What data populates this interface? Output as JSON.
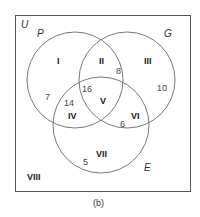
{
  "diagram": {
    "type": "venn-3-set",
    "caption": "(b)",
    "universe": {
      "label": "U"
    },
    "sets": [
      {
        "id": "P",
        "label": "P"
      },
      {
        "id": "G",
        "label": "G"
      },
      {
        "id": "E",
        "label": "E"
      }
    ],
    "regions": {
      "I": {
        "label": "I",
        "count": "7",
        "description": "P only"
      },
      "II": {
        "label": "II",
        "count": "8",
        "description": "P and G only"
      },
      "III": {
        "label": "III",
        "count": "10",
        "description": "G only"
      },
      "IV": {
        "label": "IV",
        "count": "14",
        "description": "P and E only"
      },
      "V": {
        "label": "V",
        "count": "16",
        "description": "P, G and E"
      },
      "VI": {
        "label": "VI",
        "count": "6",
        "description": "G and E only"
      },
      "VII": {
        "label": "VII",
        "count": "5",
        "description": "E only"
      },
      "VIII": {
        "label": "VIII",
        "count": "",
        "description": "outside P, G and E"
      }
    },
    "colors": {
      "frame": "#555555",
      "circle": "#6a6a6a",
      "text": "#222222"
    }
  }
}
